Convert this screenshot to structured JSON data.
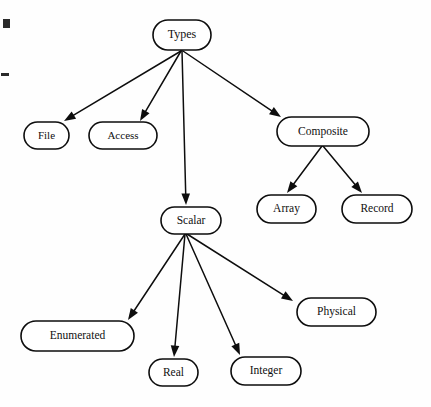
{
  "diagram": {
    "title": "Types",
    "kind": "tree-hierarchy",
    "canvas": {
      "width": 431,
      "height": 407,
      "background": "#fefefe"
    },
    "style": {
      "node_fill": "#ffffff",
      "node_stroke": "#0d0d0d",
      "node_stroke_width": 1.6,
      "edge_stroke": "#0d0d0d",
      "edge_stroke_width": 1.5,
      "text_color": "#101010"
    },
    "nodes": [
      {
        "id": "types",
        "label": "Types",
        "x": 153,
        "y": 20,
        "w": 58,
        "h": 30,
        "font_size": 12
      },
      {
        "id": "file",
        "label": "File",
        "x": 24,
        "y": 122,
        "w": 45,
        "h": 27,
        "font_size": 11
      },
      {
        "id": "access",
        "label": "Access",
        "x": 89,
        "y": 122,
        "w": 68,
        "h": 27,
        "font_size": 11
      },
      {
        "id": "composite",
        "label": "Composite",
        "x": 277,
        "y": 117,
        "w": 92,
        "h": 29,
        "font_size": 11.5
      },
      {
        "id": "array",
        "label": "Array",
        "x": 257,
        "y": 195,
        "w": 59,
        "h": 28,
        "font_size": 11.5
      },
      {
        "id": "record",
        "label": "Record",
        "x": 342,
        "y": 195,
        "w": 70,
        "h": 28,
        "font_size": 11.5
      },
      {
        "id": "scalar",
        "label": "Scalar",
        "x": 161,
        "y": 207,
        "w": 60,
        "h": 27,
        "font_size": 11.5
      },
      {
        "id": "enumerated",
        "label": "Enumerated",
        "x": 21,
        "y": 321,
        "w": 113,
        "h": 30,
        "font_size": 11.5
      },
      {
        "id": "real",
        "label": "Real",
        "x": 149,
        "y": 359,
        "w": 49,
        "h": 27,
        "font_size": 11.5
      },
      {
        "id": "integer",
        "label": "Integer",
        "x": 231,
        "y": 357,
        "w": 70,
        "h": 28,
        "font_size": 11.5
      },
      {
        "id": "physical",
        "label": "Physical",
        "x": 297,
        "y": 298,
        "w": 79,
        "h": 28,
        "font_size": 11.5
      }
    ],
    "edges": [
      {
        "id": "types-file",
        "from": "types",
        "to": "file",
        "x1": 181,
        "y1": 51,
        "x2": 64,
        "y2": 121
      },
      {
        "id": "types-access",
        "from": "types",
        "to": "access",
        "x1": 181,
        "y1": 51,
        "x2": 140,
        "y2": 121
      },
      {
        "id": "types-scalar",
        "from": "types",
        "to": "scalar",
        "x1": 182,
        "y1": 51,
        "x2": 186,
        "y2": 205
      },
      {
        "id": "types-composite",
        "from": "types",
        "to": "composite",
        "x1": 183,
        "y1": 51,
        "x2": 281,
        "y2": 117
      },
      {
        "id": "composite-array",
        "from": "composite",
        "to": "array",
        "x1": 322,
        "y1": 146,
        "x2": 287,
        "y2": 193
      },
      {
        "id": "composite-record",
        "from": "composite",
        "to": "record",
        "x1": 323,
        "y1": 146,
        "x2": 362,
        "y2": 193
      },
      {
        "id": "scalar-enumerated",
        "from": "scalar",
        "to": "enumerated",
        "x1": 185,
        "y1": 234,
        "x2": 128,
        "y2": 320
      },
      {
        "id": "scalar-real",
        "from": "scalar",
        "to": "real",
        "x1": 185,
        "y1": 234,
        "x2": 174,
        "y2": 357
      },
      {
        "id": "scalar-integer",
        "from": "scalar",
        "to": "integer",
        "x1": 186,
        "y1": 234,
        "x2": 240,
        "y2": 355
      },
      {
        "id": "scalar-physical",
        "from": "scalar",
        "to": "physical",
        "x1": 187,
        "y1": 234,
        "x2": 293,
        "y2": 301
      }
    ],
    "artifacts": [
      {
        "id": "scan-mark-square",
        "x": 3,
        "y": 19,
        "w": 7,
        "h": 9
      },
      {
        "id": "scan-mark-dash",
        "x": 1,
        "y": 73,
        "w": 8,
        "h": 3
      }
    ]
  }
}
